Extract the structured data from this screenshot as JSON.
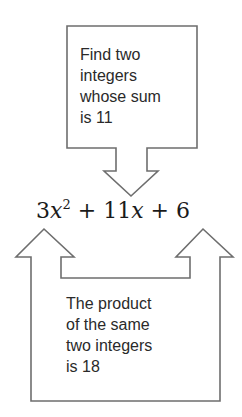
{
  "top_box": {
    "lines": [
      "Find two",
      "integers",
      "whose sum",
      "is 11"
    ]
  },
  "equation": {
    "coef_a": "3",
    "var": "x",
    "exp": "2",
    "op1": "+",
    "coef_b": "11",
    "var_b": "x",
    "op2": "+",
    "const_c": "6",
    "full_text": "3x^2 + 11x + 6"
  },
  "bottom_box": {
    "lines": [
      "The product",
      "of the same",
      "two integers",
      "is 18"
    ]
  },
  "colors": {
    "stroke": "#6e6e6e",
    "text": "#2a2a2a",
    "background": "#ffffff"
  }
}
